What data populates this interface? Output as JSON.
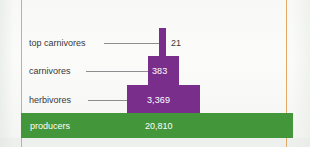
{
  "figure": {
    "name": "ecological-pyramid-of-numbers",
    "colors": {
      "producer_green": "#44963A",
      "consumer_purple": "#7A2E8C",
      "rule_orange": "#E2A55F",
      "label_text": "#37373A",
      "bar_text": "#FFFFFF"
    }
  },
  "chart_data": {
    "type": "bar",
    "title": "",
    "subtitle": "",
    "xlabel": "",
    "ylabel": "",
    "orientation": "centered-pyramid",
    "grid": false,
    "legend": "none",
    "categories": [
      "top carnivores",
      "carnivores",
      "herbivores",
      "producers"
    ],
    "values": [
      21,
      383,
      3369,
      20810
    ],
    "value_labels": [
      "21",
      "383",
      "3,369",
      "20,810"
    ],
    "series": [
      {
        "name": "number of organisms",
        "values": [
          21,
          383,
          3369,
          20810
        ]
      }
    ],
    "bar_colors": [
      "#7A2E8C",
      "#7A2E8C",
      "#7A2E8C",
      "#44963A"
    ],
    "annotations": [
      "top carnivores leader line",
      "carnivores leader line",
      "herbivores leader line"
    ]
  },
  "labels": {
    "top_carnivores": "top carnivores",
    "carnivores": "carnivores",
    "herbivores": "herbivores",
    "producers": "producers"
  },
  "values": {
    "top_carnivores": "21",
    "carnivores": "383",
    "herbivores": "3,369",
    "producers": "20,810"
  }
}
